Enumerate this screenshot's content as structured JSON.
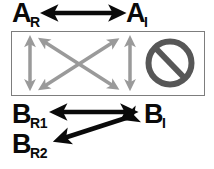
{
  "figure": {
    "width": 214,
    "height": 169,
    "background_color": "#ffffff"
  },
  "labels": {
    "a_r": {
      "base": "A",
      "sub": "R"
    },
    "a_i": {
      "base": "A",
      "sub": "I"
    },
    "b_r1": {
      "base": "B",
      "sub": "R1"
    },
    "b_i": {
      "base": "B",
      "sub": "I"
    },
    "b_r2": {
      "base": "B",
      "sub": "R2"
    }
  },
  "colors": {
    "label_black": "#0a0a0a",
    "arrow_black": "#0a0a0a",
    "arrow_gray": "#9a9a9a",
    "panel_border": "#7d7d7d",
    "prohibition_gray": "#575757",
    "background": "#ffffff"
  },
  "panel": {
    "x": 11,
    "y": 31,
    "width": 194,
    "height": 65,
    "border_color": "#7d7d7d",
    "border_width": 1.5
  },
  "arrows": {
    "top_ar_ai": {
      "name": "A_R <-> A_I",
      "color": "#0a0a0a",
      "double_headed": true,
      "x1": 46,
      "y1": 13,
      "x2": 121,
      "y2": 13,
      "stroke_width": 4.5
    },
    "panel_vertical_left": {
      "name": "left vertical",
      "color": "#9a9a9a",
      "double_headed": true,
      "x1": 30,
      "y1": 37,
      "x2": 30,
      "y2": 90,
      "stroke_width": 3.5
    },
    "panel_diag_down": {
      "name": "diagonal top-left to bottom-right",
      "color": "#9a9a9a",
      "double_headed": true,
      "x1": 40,
      "y1": 38,
      "x2": 118,
      "y2": 90,
      "stroke_width": 3.5
    },
    "panel_diag_up": {
      "name": "diagonal bottom-left to top-right",
      "color": "#9a9a9a",
      "double_headed": true,
      "x1": 40,
      "y1": 90,
      "x2": 118,
      "y2": 38,
      "stroke_width": 3.5
    },
    "panel_vertical_right": {
      "name": "right vertical",
      "color": "#9a9a9a",
      "double_headed": true,
      "x1": 130,
      "y1": 37,
      "x2": 130,
      "y2": 90,
      "stroke_width": 3.5
    },
    "bottom_br1_bi": {
      "name": "B_R1 <-> B_I",
      "color": "#0a0a0a",
      "double_headed": true,
      "x1": 55,
      "y1": 112,
      "x2": 133,
      "y2": 112,
      "stroke_width": 4.5
    },
    "bottom_bi_br2": {
      "name": "B_I <-> B_R2",
      "color": "#0a0a0a",
      "double_headed": true,
      "x1": 133,
      "y1": 118,
      "x2": 57,
      "y2": 142,
      "stroke_width": 4.5
    }
  },
  "prohibition_sign": {
    "name": "no-entry-sign",
    "center_x": 170,
    "center_y": 63,
    "radius": 24,
    "ring_width": 6,
    "slash_angle_deg": 45,
    "color": "#575757"
  }
}
